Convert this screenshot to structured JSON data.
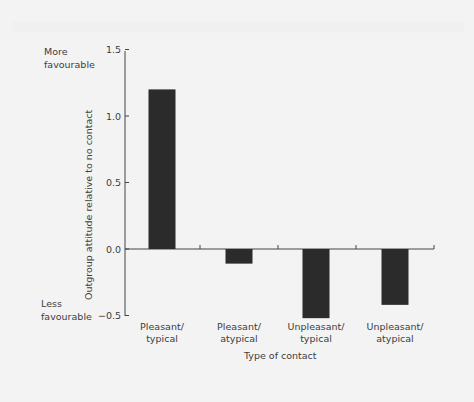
{
  "chart_data": {
    "type": "bar",
    "title": "",
    "xlabel": "Type of contact",
    "ylabel": "Outgroup attitude relative to no contact",
    "categories": [
      "Pleasant/ typical",
      "Pleasant/ atypical",
      "Unpleasant/ typical",
      "Unpleasant/ atypical"
    ],
    "category_lines": [
      [
        "Pleasant/",
        "typical"
      ],
      [
        "Pleasant/",
        "atypical"
      ],
      [
        "Unpleasant/",
        "typical"
      ],
      [
        "Unpleasant/",
        "atypical"
      ]
    ],
    "values": [
      1.2,
      -0.11,
      -0.52,
      -0.42
    ],
    "ylim": [
      -0.5,
      1.5
    ],
    "yticks": [
      "1.5",
      "1.0",
      "0.5",
      "0.0",
      "-0.5"
    ],
    "annotations": {
      "top": [
        "More",
        "favourable"
      ],
      "bottom": [
        "Less",
        "favourable"
      ]
    },
    "grid": false,
    "legend": "none",
    "bar_color": "#2b2b2b"
  }
}
